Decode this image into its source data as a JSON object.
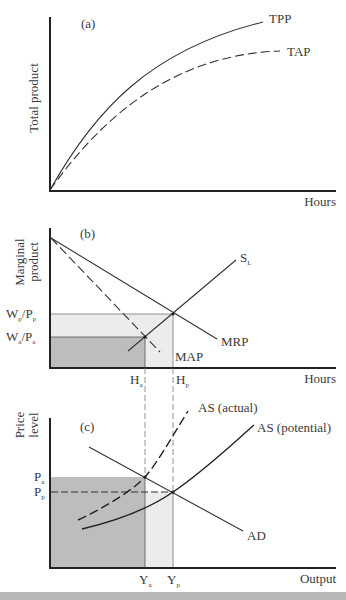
{
  "panels": {
    "a": {
      "tag": "(a)",
      "ylabel": "Total product",
      "xlabel": "Hours",
      "curves": {
        "tpp": "TPP",
        "tap": "TAP"
      }
    },
    "b": {
      "tag": "(b)",
      "ylabel_line1": "Marginal",
      "ylabel_line2": "product",
      "xlabel": "Hours",
      "curves": {
        "sl_main": "S",
        "sl_sub": "L",
        "mrp": "MRP",
        "map": "MAP"
      },
      "ticks_y": {
        "wp_w": "W",
        "wp_ws": "p",
        "wp_p": "/P",
        "wp_ps": "p",
        "wa_w": "W",
        "wa_ws": "a",
        "wa_p": "/P",
        "wa_ps": "a"
      },
      "ticks_x": {
        "ha": "H",
        "ha_sub": "a",
        "hp": "H",
        "hp_sub": "p"
      }
    },
    "c": {
      "tag": "(c)",
      "ylabel_line1": "Price",
      "ylabel_line2": "level",
      "xlabel": "Output",
      "curves": {
        "as_actual": "AS (actual)",
        "as_potential": "AS (potential)",
        "ad": "AD"
      },
      "ticks_y": {
        "pa": "P",
        "pa_sub": "a",
        "pp": "P",
        "pp_sub": "p"
      },
      "ticks_x": {
        "ya": "Y",
        "ya_sub": "a",
        "yp": "Y",
        "yp_sub": "p"
      }
    }
  },
  "colors": {
    "shade_dark": "#bdbdbd",
    "shade_light": "#ececec",
    "line": "#333333"
  }
}
